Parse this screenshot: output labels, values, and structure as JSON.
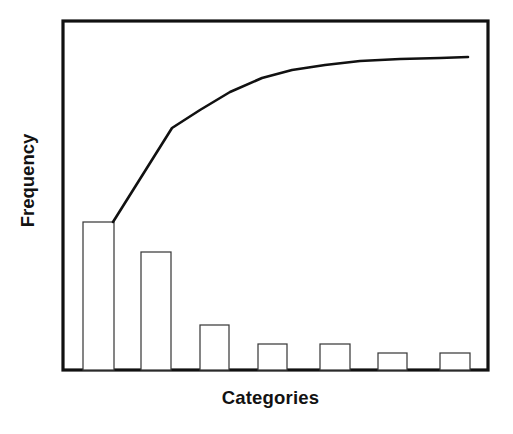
{
  "chart_data": {
    "type": "bar",
    "title": "",
    "subtitle": "",
    "xlabel": "Categories",
    "ylabel": "Frequency",
    "categories": [
      "1",
      "2",
      "3",
      "4",
      "5",
      "6",
      "7"
    ],
    "values": [
      42,
      33,
      13,
      7.5,
      7.5,
      5,
      5
    ],
    "series": [
      {
        "name": "Frequency",
        "type": "bar",
        "values": [
          42,
          33,
          13,
          7.5,
          7.5,
          5,
          5
        ]
      },
      {
        "name": "Cumulative Percentage",
        "type": "line",
        "values": [
          42,
          75,
          88,
          95.5,
          97,
          98.5,
          100
        ]
      }
    ],
    "ylim": [
      0,
      100
    ],
    "ylim_secondary": [
      0,
      100
    ],
    "grid": false,
    "legend": false,
    "legend_position": "none",
    "xtick_labels": [],
    "ytick_labels": [],
    "annotations": [],
    "colors": {
      "bar_fill": "#ffffff",
      "bar_stroke": "#3b3b3b",
      "line": "#111111",
      "frame": "#111111",
      "text": "#121212",
      "background": "#ffffff"
    },
    "geometry": {
      "plot_left": 63,
      "plot_right": 488,
      "plot_top": 21,
      "plot_bottom": 370,
      "bars": [
        {
          "x": 83,
          "width": 31,
          "top": 222
        },
        {
          "x": 141,
          "width": 30,
          "top": 252
        },
        {
          "x": 200,
          "width": 29,
          "top": 325
        },
        {
          "x": 258,
          "width": 29,
          "top": 344
        },
        {
          "x": 320,
          "width": 30,
          "top": 344
        },
        {
          "x": 378,
          "width": 29,
          "top": 353
        },
        {
          "x": 440,
          "width": 30,
          "top": 353
        }
      ],
      "line_points": [
        [
          113,
          222
        ],
        [
          172,
          128
        ],
        [
          200,
          110
        ],
        [
          230,
          92
        ],
        [
          262,
          78
        ],
        [
          292,
          70
        ],
        [
          325,
          65
        ],
        [
          360,
          61
        ],
        [
          400,
          59
        ],
        [
          440,
          58
        ],
        [
          468,
          57
        ]
      ]
    }
  },
  "axes": {
    "y_title": "Frequency",
    "x_title": "Categories"
  }
}
